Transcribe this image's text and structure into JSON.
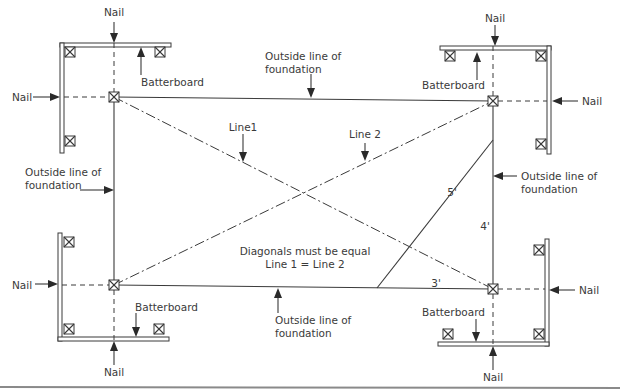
{
  "diagram": {
    "labels": {
      "nail": "Nail",
      "batterboard": "Batterboard",
      "outside_line_1": "Outside line of",
      "outside_line_2": "foundation",
      "line1": "Line1",
      "line2": "Line 2",
      "diagonals_note_1": "Diagonals must be equal",
      "diagonals_note_2": "Line 1 = Line 2",
      "dim_3": "3'",
      "dim_4": "4'",
      "dim_5": "5'"
    },
    "corners": [
      {
        "id": "top-left",
        "x": 114,
        "y": 97
      },
      {
        "id": "top-right",
        "x": 493,
        "y": 101
      },
      {
        "id": "bottom-left",
        "x": 114,
        "y": 285
      },
      {
        "id": "bottom-right",
        "x": 493,
        "y": 289
      }
    ],
    "colors": {
      "line": "#3a3a3a",
      "background": "#ffffff",
      "rule": "#8a8a8a"
    }
  }
}
